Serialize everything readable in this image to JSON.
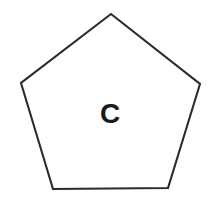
{
  "canvas": {
    "width": 215,
    "height": 205,
    "background_color": "#ffffff"
  },
  "shape": {
    "name": "pentagon",
    "sides": 5,
    "label": "C",
    "stroke_color": "#2b2b2b",
    "stroke_width": 2.1,
    "fill_color": "#ffffff",
    "points": "111,14 200,84 168,188 53,189 21,83",
    "vertices": [
      {
        "id": "apex",
        "x": 111,
        "y": 14
      },
      {
        "id": "right",
        "x": 200,
        "y": 84
      },
      {
        "id": "bottom-right",
        "x": 168,
        "y": 188
      },
      {
        "id": "bottom-left",
        "x": 53,
        "y": 189
      },
      {
        "id": "left",
        "x": 21,
        "y": 83
      }
    ]
  },
  "label": {
    "text": "C",
    "color": "#1a1a1a",
    "font_size": 28,
    "font_weight": "bold",
    "center_x": 110,
    "center_y": 116
  }
}
